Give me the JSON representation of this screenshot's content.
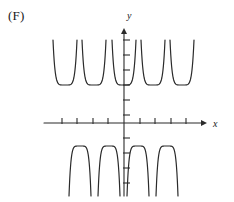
{
  "figure": {
    "part_label": "(F)",
    "stroke_color": "#2b2b2b",
    "axis_color": "#2b2b2b",
    "background_color": "#ffffff"
  },
  "axes": {
    "x_axis_label": "x",
    "y_axis_label": "y",
    "origin": {
      "x": 124,
      "y": 123
    },
    "x_axis": {
      "start_x": 44,
      "end_x": 207,
      "y": 123,
      "arrow": "right",
      "tick_half_length": 5,
      "tick_positions": [
        62,
        77,
        93,
        108,
        140,
        155,
        171,
        186
      ]
    },
    "y_axis": {
      "x": 124,
      "start_y": 28,
      "end_y": 196,
      "arrow": "up",
      "tick_half_length": 5,
      "tick_positions": [
        40,
        55,
        70,
        85,
        100,
        115,
        138,
        153,
        168,
        183
      ]
    }
  },
  "chart_data": {
    "type": "line",
    "title": "",
    "xlabel": "x",
    "ylabel": "y",
    "grid": false,
    "legend": null,
    "branch_count_above": 5,
    "branch_count_below": 4,
    "branches_above_axis": [
      {
        "center_x": 65,
        "half_width": 12,
        "vertex_y": 85,
        "top_y": 40
      },
      {
        "center_x": 94,
        "half_width": 12,
        "vertex_y": 85,
        "top_y": 40
      },
      {
        "center_x": 124,
        "half_width": 12,
        "vertex_y": 85,
        "top_y": 40
      },
      {
        "center_x": 153,
        "half_width": 12,
        "vertex_y": 85,
        "top_y": 40
      },
      {
        "center_x": 182,
        "half_width": 12,
        "vertex_y": 85,
        "top_y": 40
      }
    ],
    "branches_below_axis": [
      {
        "center_x": 80,
        "half_width": 11,
        "vertex_y": 146,
        "bottom_y": 196
      },
      {
        "center_x": 109,
        "half_width": 11,
        "vertex_y": 146,
        "bottom_y": 196
      },
      {
        "center_x": 138,
        "half_width": 11,
        "vertex_y": 146,
        "bottom_y": 196
      },
      {
        "center_x": 167,
        "half_width": 11,
        "vertex_y": 146,
        "bottom_y": 196
      }
    ]
  }
}
